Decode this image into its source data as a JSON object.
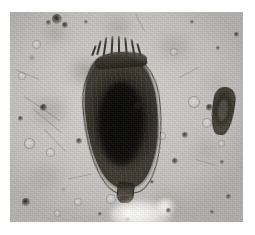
{
  "image": {
    "kind": "photomicrograph",
    "modality": "brightfield light microscopy",
    "caption": "",
    "frame": {
      "canvas_width": 255,
      "canvas_height": 235,
      "margin_color": "#ffffff",
      "field_left": 10,
      "field_top": 12,
      "field_width": 233,
      "field_height": 210
    },
    "palette": {
      "background": "#c9c7c3",
      "background_light": "#d6d4d0",
      "background_dark": "#96948f",
      "specimen_dark": "#141210",
      "specimen_mid": "#3e392f",
      "specimen_light": "#6a6356",
      "highlight": "#ffffff"
    }
  },
  "subjects": {
    "primary": {
      "label": "main-specimen",
      "description": "large dark ovoid lorica with anterior spines and posterior foot",
      "bbox": {
        "x": 70,
        "y": 24,
        "width": 84,
        "height": 172
      },
      "features": [
        "anterior-spines",
        "anterior-rim",
        "lorica-body",
        "longitudinal-striations",
        "dark-internal-core",
        "translucent-left-shoulder",
        "translucent-right-flange",
        "posterior-foot",
        "foot-tip"
      ]
    },
    "secondary": {
      "label": "small-specimen",
      "description": "small elongate dark body at right of field",
      "bbox": {
        "x": 202,
        "y": 75,
        "width": 22,
        "height": 48
      }
    },
    "bright_blob": {
      "label": "out-of-focus-bright-cluster",
      "description": "bright defocused cluster near lower centre",
      "bbox": {
        "x": 100,
        "y": 186,
        "width": 66,
        "height": 32
      }
    }
  },
  "spines": [
    {
      "left": 18,
      "top": 4,
      "width": 2,
      "height": 15,
      "rotate": 14
    },
    {
      "left": 24,
      "top": 1,
      "width": 2,
      "height": 19,
      "rotate": 8
    },
    {
      "left": 31,
      "top": 0,
      "width": 2,
      "height": 21,
      "rotate": 3
    },
    {
      "left": 38,
      "top": 0,
      "width": 2,
      "height": 21,
      "rotate": -1
    },
    {
      "left": 45,
      "top": 1,
      "width": 2,
      "height": 19,
      "rotate": -5
    },
    {
      "left": 52,
      "top": 3,
      "width": 2,
      "height": 17,
      "rotate": -10
    },
    {
      "left": 58,
      "top": 7,
      "width": 2,
      "height": 13,
      "rotate": -16
    },
    {
      "left": 13,
      "top": 9,
      "width": 2,
      "height": 11,
      "rotate": 20
    }
  ],
  "blur_patches": [
    {
      "left": 62,
      "top": 48,
      "width": 26,
      "height": 22,
      "color": "rgba(150,147,142,0.55)"
    },
    {
      "left": 24,
      "top": 86,
      "width": 30,
      "height": 26,
      "color": "rgba(158,155,150,0.48)"
    },
    {
      "left": 18,
      "top": 152,
      "width": 34,
      "height": 26,
      "color": "rgba(160,157,152,0.40)"
    },
    {
      "left": 150,
      "top": 24,
      "width": 28,
      "height": 22,
      "color": "rgba(156,153,148,0.42)"
    },
    {
      "left": 186,
      "top": 128,
      "width": 22,
      "height": 20,
      "color": "rgba(162,159,154,0.40)"
    },
    {
      "left": 142,
      "top": 178,
      "width": 30,
      "height": 24,
      "color": "rgba(164,161,156,0.38)"
    },
    {
      "left": 96,
      "top": 6,
      "width": 24,
      "height": 18,
      "color": "rgba(152,149,144,0.45)"
    },
    {
      "left": 198,
      "top": 62,
      "width": 20,
      "height": 18,
      "color": "rgba(166,163,158,0.36)"
    },
    {
      "left": 36,
      "top": 12,
      "width": 18,
      "height": 16,
      "color": "rgba(140,137,132,0.48)"
    }
  ],
  "fibers": [
    {
      "left": 10,
      "top": 96,
      "width": 44,
      "height": 1.4,
      "rotate": 34
    },
    {
      "left": 18,
      "top": 108,
      "width": 38,
      "height": 1.2,
      "rotate": 40
    },
    {
      "left": 30,
      "top": 128,
      "width": 30,
      "height": 1.1,
      "rotate": 46
    },
    {
      "left": 4,
      "top": 62,
      "width": 26,
      "height": 1.0,
      "rotate": 22
    },
    {
      "left": 168,
      "top": 60,
      "width": 22,
      "height": 1.0,
      "rotate": -28
    },
    {
      "left": 186,
      "top": 150,
      "width": 20,
      "height": 1.0,
      "rotate": 16
    },
    {
      "left": 58,
      "top": 164,
      "width": 24,
      "height": 1.0,
      "rotate": -12
    },
    {
      "left": 120,
      "top": 10,
      "width": 20,
      "height": 1.0,
      "rotate": 62
    }
  ],
  "specks": [
    {
      "left": 42,
      "top": 2,
      "size": 10,
      "color": "rgba(24,22,18,0.92)",
      "blur": 0.6
    },
    {
      "left": 52,
      "top": 10,
      "size": 6,
      "color": "rgba(30,27,22,0.88)",
      "blur": 0.5
    },
    {
      "left": 36,
      "top": 8,
      "size": 5,
      "color": "rgba(44,40,33,0.75)",
      "blur": 0.7
    },
    {
      "left": 30,
      "top": 92,
      "size": 7,
      "color": "rgba(28,25,21,0.90)",
      "blur": 0.5
    },
    {
      "left": 8,
      "top": 104,
      "size": 5,
      "color": "rgba(40,36,30,0.80)",
      "blur": 0.6
    },
    {
      "left": 12,
      "top": 186,
      "size": 8,
      "color": "rgba(26,23,19,0.92)",
      "blur": 0.5
    },
    {
      "left": 124,
      "top": 90,
      "size": 7,
      "color": "rgba(30,27,22,0.88)",
      "blur": 0.5
    },
    {
      "left": 66,
      "top": 126,
      "size": 6,
      "color": "rgba(36,32,27,0.82)",
      "blur": 0.6
    },
    {
      "left": 172,
      "top": 120,
      "size": 6,
      "color": "rgba(34,31,26,0.84)",
      "blur": 0.5
    },
    {
      "left": 196,
      "top": 92,
      "size": 7,
      "color": "rgba(28,25,21,0.88)",
      "blur": 0.5
    },
    {
      "left": 162,
      "top": 146,
      "size": 6,
      "color": "rgba(36,32,27,0.82)",
      "blur": 0.6
    },
    {
      "left": 210,
      "top": 148,
      "size": 4,
      "color": "rgba(46,42,35,0.72)",
      "blur": 0.6
    },
    {
      "left": 224,
      "top": 20,
      "size": 5,
      "color": "rgba(40,36,30,0.78)",
      "blur": 0.6
    },
    {
      "left": 206,
      "top": 34,
      "size": 4,
      "color": "rgba(50,45,38,0.68)",
      "blur": 0.7
    },
    {
      "left": 140,
      "top": 168,
      "size": 4,
      "color": "rgba(48,43,36,0.70)",
      "blur": 0.7
    },
    {
      "left": 88,
      "top": 200,
      "size": 4,
      "color": "rgba(52,47,39,0.66)",
      "blur": 0.7
    },
    {
      "left": 156,
      "top": 196,
      "size": 5,
      "color": "rgba(40,36,30,0.74)",
      "blur": 0.6
    },
    {
      "left": 216,
      "top": 182,
      "size": 5,
      "color": "rgba(44,40,33,0.72)",
      "blur": 0.6
    },
    {
      "left": 180,
      "top": 8,
      "size": 4,
      "color": "rgba(50,45,38,0.66)",
      "blur": 0.7
    },
    {
      "left": 74,
      "top": 8,
      "size": 4,
      "color": "rgba(54,49,41,0.62)",
      "blur": 0.7
    },
    {
      "left": 20,
      "top": 44,
      "size": 4,
      "color": "rgba(56,51,43,0.60)",
      "blur": 0.8
    },
    {
      "left": 200,
      "top": 198,
      "size": 4,
      "color": "rgba(50,45,38,0.66)",
      "blur": 0.7
    },
    {
      "left": 116,
      "top": 206,
      "size": 3,
      "color": "rgba(58,53,45,0.58)",
      "blur": 0.8
    },
    {
      "left": 52,
      "top": 176,
      "size": 3,
      "color": "rgba(60,55,46,0.56)",
      "blur": 0.8
    }
  ],
  "bubbles": [
    {
      "left": 14,
      "top": 126,
      "size": 9,
      "ring": "rgba(120,117,112,0.55)"
    },
    {
      "left": 36,
      "top": 136,
      "size": 7,
      "ring": "rgba(126,123,118,0.50)"
    },
    {
      "left": 178,
      "top": 84,
      "size": 10,
      "ring": "rgba(122,119,114,0.52)"
    },
    {
      "left": 192,
      "top": 106,
      "size": 8,
      "ring": "rgba(128,125,120,0.48)"
    },
    {
      "left": 96,
      "top": 182,
      "size": 8,
      "ring": "rgba(130,127,122,0.46)"
    },
    {
      "left": 64,
      "top": 186,
      "size": 6,
      "ring": "rgba(134,131,126,0.44)"
    },
    {
      "left": 148,
      "top": 120,
      "size": 6,
      "ring": "rgba(132,129,124,0.45)"
    },
    {
      "left": 22,
      "top": 28,
      "size": 7,
      "ring": "rgba(130,127,122,0.46)"
    },
    {
      "left": 8,
      "top": 60,
      "size": 6,
      "ring": "rgba(134,131,126,0.44)"
    },
    {
      "left": 160,
      "top": 36,
      "size": 6,
      "ring": "rgba(134,131,126,0.44)"
    },
    {
      "left": 208,
      "top": 128,
      "size": 5,
      "ring": "rgba(136,133,128,0.42)"
    },
    {
      "left": 44,
      "top": 198,
      "size": 5,
      "ring": "rgba(136,133,128,0.42)"
    }
  ]
}
